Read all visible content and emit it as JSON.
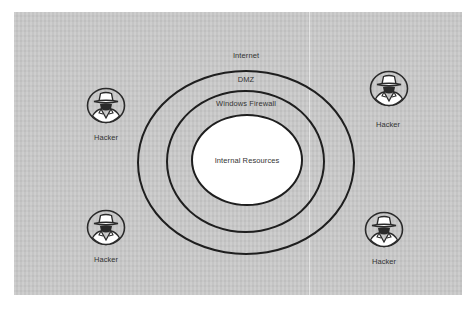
{
  "diagram": {
    "zones": [
      {
        "label": "Internet"
      },
      {
        "label": "DMZ"
      },
      {
        "label": "Windows Firewall"
      },
      {
        "label": "Internal Resources"
      }
    ],
    "hackers": [
      {
        "label": "Hacker",
        "position": "top-left"
      },
      {
        "label": "Hacker",
        "position": "top-right"
      },
      {
        "label": "Hacker",
        "position": "bottom-left"
      },
      {
        "label": "Hacker",
        "position": "bottom-right"
      }
    ],
    "colors": {
      "background": "#c9c9c9",
      "ring_stroke": "#1e1e1e",
      "core_fill": "#ffffff",
      "text": "#333333"
    }
  }
}
